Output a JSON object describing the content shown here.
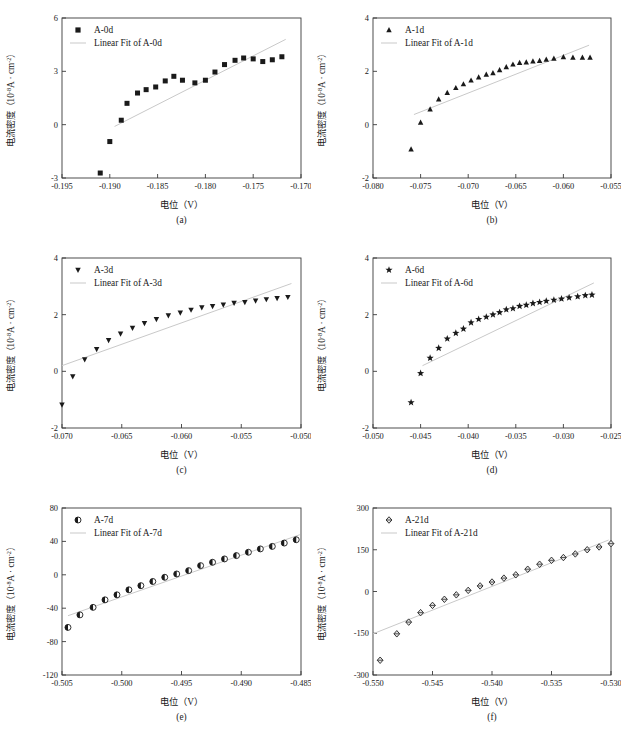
{
  "figure": {
    "xlabel": "电位（V）",
    "ylabel_main": "电流密度（10",
    "ylabel_exp": "-8",
    "ylabel_mid": "A · cm",
    "ylabel_exp2": "-2",
    "ylabel_tail": "）",
    "fit_prefix": "Linear Fit of ",
    "line_color": "#c9c9c9",
    "marker_color": "#1a1a1a",
    "axis_color": "#3a3a3a"
  },
  "chart_data": [
    {
      "type": "scatter",
      "panel": "a",
      "caption": "(a)",
      "series_name": "A-0d",
      "fit_name": "Linear Fit of A-0d",
      "marker": "square",
      "xlabel": "电位（V）",
      "ylabel": "电流密度（10-8A · cm-2）",
      "xlim": [
        -0.195,
        -0.17
      ],
      "ylim": [
        -3,
        6
      ],
      "xticks": [
        -0.195,
        -0.19,
        -0.185,
        -0.18,
        -0.175,
        -0.17
      ],
      "xticklabels": [
        "-0.195",
        "-0.190",
        "-0.185",
        "-0.180",
        "-0.175",
        "-0.170"
      ],
      "yticks": [
        -3,
        0,
        3,
        6
      ],
      "yticklabels": [
        "-3",
        "0",
        "3",
        "6"
      ],
      "x": [
        -0.191,
        -0.19,
        -0.1888,
        -0.1882,
        -0.1871,
        -0.1862,
        -0.1852,
        -0.1842,
        -0.1833,
        -0.1824,
        -0.1811,
        -0.18,
        -0.179,
        -0.178,
        -0.1769,
        -0.176,
        -0.175,
        -0.174,
        -0.173,
        -0.172
      ],
      "y": [
        -2.72,
        -0.95,
        0.25,
        1.2,
        1.78,
        1.97,
        2.12,
        2.46,
        2.72,
        2.5,
        2.35,
        2.5,
        2.96,
        3.38,
        3.62,
        3.75,
        3.7,
        3.55,
        3.65,
        3.82
      ],
      "fit": {
        "x": [
          -0.1895,
          -0.1716
        ],
        "y": [
          -0.1,
          4.8
        ]
      },
      "grid": false,
      "legend_position": "top-left"
    },
    {
      "type": "scatter",
      "panel": "b",
      "caption": "(b)",
      "series_name": "A-1d",
      "fit_name": "Linear Fit of A-1d",
      "marker": "triangle-up",
      "xlabel": "电位（V）",
      "ylabel": "电流密度（10-8A · cm-2）",
      "xlim": [
        -0.08,
        -0.055
      ],
      "ylim": [
        -2,
        4
      ],
      "xticks": [
        -0.08,
        -0.075,
        -0.07,
        -0.065,
        -0.06,
        -0.055
      ],
      "xticklabels": [
        "-0.080",
        "-0.075",
        "-0.070",
        "-0.065",
        "-0.060",
        "-0.055"
      ],
      "yticks": [
        -2,
        0,
        2,
        4
      ],
      "yticklabels": [
        "-2",
        "0",
        "2",
        "4"
      ],
      "x": [
        -0.076,
        -0.075,
        -0.074,
        -0.0731,
        -0.0722,
        -0.0713,
        -0.0705,
        -0.0697,
        -0.0689,
        -0.0681,
        -0.0674,
        -0.0667,
        -0.066,
        -0.0653,
        -0.0646,
        -0.0639,
        -0.0632,
        -0.0625,
        -0.0618,
        -0.061,
        -0.06,
        -0.059,
        -0.058,
        -0.0572
      ],
      "y": [
        -0.92,
        0.08,
        0.58,
        0.95,
        1.2,
        1.38,
        1.52,
        1.66,
        1.78,
        1.88,
        1.94,
        2.05,
        2.16,
        2.26,
        2.32,
        2.34,
        2.38,
        2.4,
        2.44,
        2.48,
        2.54,
        2.52,
        2.52,
        2.52
      ],
      "fit": {
        "x": [
          -0.0757,
          -0.0573
        ],
        "y": [
          0.38,
          2.98
        ]
      },
      "grid": false,
      "legend_position": "top-left"
    },
    {
      "type": "scatter",
      "panel": "c",
      "caption": "(c)",
      "series_name": "A-3d",
      "fit_name": "Linear Fit of A-3d",
      "marker": "triangle-down",
      "xlabel": "电位（V）",
      "ylabel": "电流密度（10-8A · cm-2）",
      "xlim": [
        -0.07,
        -0.05
      ],
      "ylim": [
        -2,
        4
      ],
      "xticks": [
        -0.07,
        -0.065,
        -0.06,
        -0.055,
        -0.05
      ],
      "xticklabels": [
        "-0.070",
        "-0.065",
        "-0.060",
        "-0.055",
        "-0.050"
      ],
      "yticks": [
        -2,
        0,
        2,
        4
      ],
      "yticklabels": [
        "-2",
        "0",
        "2",
        "4"
      ],
      "x": [
        -0.07,
        -0.0691,
        -0.0681,
        -0.0671,
        -0.0661,
        -0.0651,
        -0.0641,
        -0.0631,
        -0.0621,
        -0.0611,
        -0.0601,
        -0.0592,
        -0.0583,
        -0.0574,
        -0.0565,
        -0.0556,
        -0.0547,
        -0.0538,
        -0.0529,
        -0.052,
        -0.0511
      ],
      "y": [
        -1.18,
        -0.18,
        0.42,
        0.78,
        1.1,
        1.33,
        1.53,
        1.7,
        1.84,
        1.97,
        2.07,
        2.17,
        2.25,
        2.3,
        2.35,
        2.41,
        2.44,
        2.49,
        2.54,
        2.58,
        2.62
      ],
      "fit": {
        "x": [
          -0.07,
          -0.0508
        ],
        "y": [
          0.2,
          3.1
        ]
      },
      "grid": false,
      "legend_position": "top-left"
    },
    {
      "type": "scatter",
      "panel": "d",
      "caption": "(d)",
      "series_name": "A-6d",
      "fit_name": "Linear Fit of A-6d",
      "marker": "star",
      "xlabel": "电位（V）",
      "ylabel": "电流密度（10-8A · cm-2）",
      "xlim": [
        -0.05,
        -0.025
      ],
      "ylim": [
        -2,
        4
      ],
      "xticks": [
        -0.05,
        -0.045,
        -0.04,
        -0.035,
        -0.03,
        -0.025
      ],
      "xticklabels": [
        "-0.050",
        "-0.045",
        "-0.040",
        "-0.035",
        "-0.030",
        "-0.025"
      ],
      "yticks": [
        -2,
        0,
        2,
        4
      ],
      "yticklabels": [
        "-2",
        "0",
        "2",
        "4"
      ],
      "x": [
        -0.046,
        -0.045,
        -0.044,
        -0.0431,
        -0.0422,
        -0.0413,
        -0.0405,
        -0.0397,
        -0.0389,
        -0.0381,
        -0.0374,
        -0.0367,
        -0.036,
        -0.0353,
        -0.0346,
        -0.0339,
        -0.0332,
        -0.0325,
        -0.0318,
        -0.031,
        -0.0302,
        -0.0294,
        -0.0285,
        -0.0277,
        -0.027
      ],
      "y": [
        -1.1,
        -0.07,
        0.47,
        0.82,
        1.15,
        1.35,
        1.5,
        1.72,
        1.84,
        1.92,
        2.0,
        2.08,
        2.18,
        2.22,
        2.3,
        2.34,
        2.4,
        2.44,
        2.48,
        2.52,
        2.56,
        2.6,
        2.64,
        2.68,
        2.7
      ],
      "fit": {
        "x": [
          -0.0448,
          -0.0268
        ],
        "y": [
          0.2,
          3.12
        ]
      },
      "grid": false,
      "legend_position": "top-left"
    },
    {
      "type": "scatter",
      "panel": "e",
      "caption": "(e)",
      "series_name": "A-7d",
      "fit_name": "Linear Fit of A-7d",
      "marker": "half-circle",
      "xlabel": "电位（V）",
      "ylabel": "电流密度（10-8A · cm-2）",
      "xlim": [
        -0.505,
        -0.485
      ],
      "ylim": [
        -120,
        80
      ],
      "xticks": [
        -0.505,
        -0.5,
        -0.495,
        -0.49,
        -0.485
      ],
      "xticklabels": [
        "-0.505",
        "-0.500",
        "-0.495",
        "-0.490",
        "-0.485"
      ],
      "yticks": [
        -120,
        -80,
        -40,
        0,
        40,
        80
      ],
      "yticklabels": [
        "-120",
        "-80",
        "-40",
        "0",
        "40",
        "80"
      ],
      "x": [
        -0.5045,
        -0.5035,
        -0.5024,
        -0.5014,
        -0.5004,
        -0.4994,
        -0.4984,
        -0.4974,
        -0.4964,
        -0.4954,
        -0.4944,
        -0.4934,
        -0.4924,
        -0.4914,
        -0.4904,
        -0.4894,
        -0.4884,
        -0.4874,
        -0.4864,
        -0.4854
      ],
      "y": [
        -63,
        -48,
        -39,
        -30,
        -24,
        -18,
        -13,
        -8,
        -3,
        1,
        5,
        11,
        15,
        19,
        23,
        27,
        31,
        34,
        38,
        42
      ],
      "fit": {
        "x": [
          -0.5045,
          -0.4851
        ],
        "y": [
          -49,
          48
        ]
      },
      "grid": false,
      "legend_position": "top-left"
    },
    {
      "type": "scatter",
      "panel": "f",
      "caption": "(f)",
      "series_name": "A-21d",
      "fit_name": "Linear Fit of A-21d",
      "marker": "diamond",
      "xlabel": "电位（V）",
      "ylabel": "电流密度（10-8A · cm-2）",
      "xlim": [
        -0.55,
        -0.53
      ],
      "ylim": [
        -300,
        300
      ],
      "xticks": [
        -0.55,
        -0.545,
        -0.54,
        -0.535,
        -0.53
      ],
      "xticklabels": [
        "-0.550",
        "-0.545",
        "-0.540",
        "-0.535",
        "-0.530"
      ],
      "yticks": [
        -300,
        -150,
        0,
        150,
        300
      ],
      "yticklabels": [
        "-300",
        "-150",
        "0",
        "150",
        "300"
      ],
      "x": [
        -0.5494,
        -0.548,
        -0.547,
        -0.546,
        -0.545,
        -0.544,
        -0.543,
        -0.542,
        -0.541,
        -0.54,
        -0.539,
        -0.538,
        -0.537,
        -0.536,
        -0.535,
        -0.534,
        -0.533,
        -0.532,
        -0.531,
        -0.53
      ],
      "y": [
        -247,
        -152,
        -110,
        -76,
        -50,
        -28,
        -12,
        4,
        20,
        34,
        48,
        60,
        80,
        98,
        112,
        122,
        135,
        150,
        160,
        172
      ],
      "fit": {
        "x": [
          -0.55,
          -0.5302
        ],
        "y": [
          -152,
          185
        ]
      },
      "grid": false,
      "legend_position": "top-left"
    }
  ]
}
